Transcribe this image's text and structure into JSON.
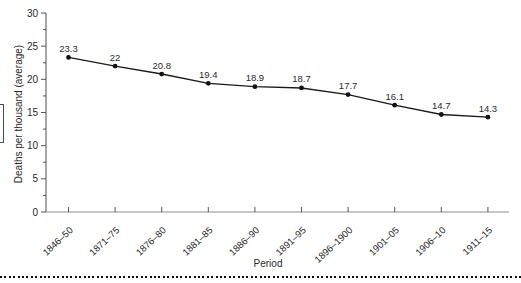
{
  "figure": {
    "y_axis_title": "Deaths per thousand (average)",
    "x_axis_title": "Period"
  },
  "chart_data": {
    "type": "line",
    "title": "",
    "xlabel": "Period",
    "ylabel": "Deaths per thousand (average)",
    "categories": [
      "1846–50",
      "1871–75",
      "1876–80",
      "1881–85",
      "1886–90",
      "1891–95",
      "1896–1900",
      "1901–05",
      "1906–10",
      "1911–15"
    ],
    "series": [
      {
        "name": "Deaths per thousand (average)",
        "values": [
          23.3,
          22,
          20.8,
          19.4,
          18.9,
          18.7,
          17.7,
          16.1,
          14.7,
          14.3
        ],
        "point_labels": [
          "23.3",
          "22",
          "20.8",
          "19.4",
          "18.9",
          "18.7",
          "17.7",
          "16.1",
          "14.7",
          "14.3"
        ]
      }
    ],
    "ylim": [
      0,
      30
    ],
    "y_major_ticks": [
      0,
      5,
      10,
      15,
      20,
      25,
      30
    ],
    "y_minor_step": 2.5,
    "grid": false,
    "legend": false,
    "marker": "filled-circle",
    "colors": {
      "line": "#1a1a1a",
      "marker": "#111111",
      "text": "#2a2a2a",
      "x_axis_line": "#8f8f8f",
      "y_axis_line": "#6b6b6b",
      "tick": "#555555"
    }
  }
}
